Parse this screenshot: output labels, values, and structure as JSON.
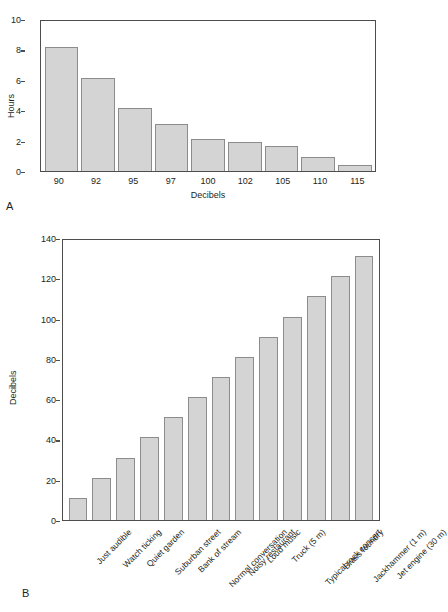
{
  "figure": {
    "panel_a_letter": "A",
    "panel_b_letter": "B"
  },
  "chart_data": [
    {
      "id": "panel-a",
      "type": "bar",
      "title": "",
      "xlabel": "Decibels",
      "ylabel": "Hours",
      "categories": [
        "90",
        "92",
        "95",
        "97",
        "100",
        "102",
        "105",
        "110",
        "115"
      ],
      "values": [
        8.15,
        6.15,
        4.15,
        3.1,
        2.1,
        1.9,
        1.65,
        0.9,
        0.4
      ],
      "ylim": [
        0,
        10
      ],
      "yticks": [
        0,
        2,
        4,
        6,
        8,
        10
      ],
      "ytick_labels": [
        "0",
        "2",
        "4",
        "6",
        "8",
        "10"
      ],
      "grid": false,
      "legend": "none",
      "bar_color": "#d4d4d4",
      "bar_edge_color": "#8c8c8c",
      "axis_color": "#4d4d4d"
    },
    {
      "id": "panel-b",
      "type": "bar",
      "title": "",
      "xlabel": "",
      "ylabel": "Decibels",
      "categories": [
        "Just audible",
        "Watch ticking",
        "Quiet garden",
        "Suburban street",
        "Bank of stream",
        "Normal conversation",
        "Noisy restaurant",
        "Loud music",
        "Truck (5 m)",
        "Typical rock concert",
        "Brass foundry",
        "Jackhammer (1 m)",
        "Jet engine (30 m)"
      ],
      "values": [
        11,
        21,
        31,
        41,
        51,
        61,
        71,
        81,
        91,
        101,
        111,
        121,
        131
      ],
      "ylim": [
        0,
        140
      ],
      "yticks": [
        0,
        20,
        40,
        60,
        80,
        100,
        120,
        140
      ],
      "ytick_labels": [
        "0",
        "20",
        "40",
        "60",
        "80",
        "100",
        "120",
        "140"
      ],
      "grid": false,
      "legend": "none",
      "bar_color": "#d4d4d4",
      "bar_edge_color": "#8c8c8c",
      "axis_color": "#4d4d4d"
    }
  ]
}
